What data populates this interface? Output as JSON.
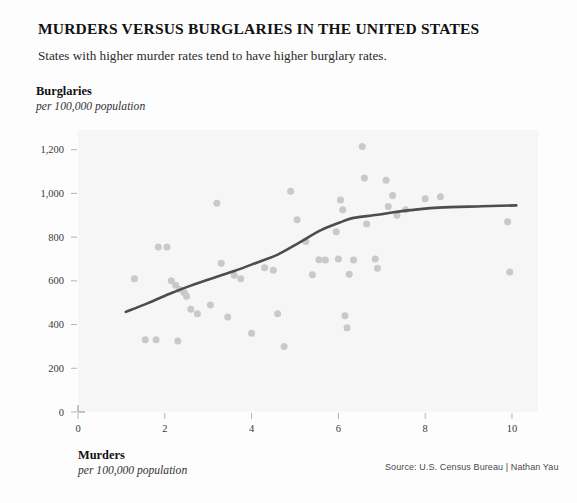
{
  "header": {
    "title": "MURDERS VERSUS BURGLARIES IN THE UNITED STATES",
    "subtitle": "States with higher murder rates tend to have higher burglary rates."
  },
  "y_axis": {
    "title": "Burglaries",
    "units": "per 100,000 population"
  },
  "x_axis": {
    "title": "Murders",
    "units": "per 100,000 population"
  },
  "source": "Source: U.S. Census Bureau | Nathan Yau",
  "colors": {
    "dot": "#c9c9c9",
    "trend_line": "#4d4d4d",
    "plot_background": "#f6f6f6",
    "text": "#222222",
    "page_background": "#fdfdfd"
  },
  "chart_data": {
    "type": "scatter",
    "title": "MURDERS VERSUS BURGLARIES IN THE UNITED STATES",
    "subtitle": "States with higher murder rates tend to have higher burglary rates.",
    "xlabel": "Murders",
    "xlabel_units": "per 100,000 population",
    "ylabel": "Burglaries",
    "ylabel_units": "per 100,000 population",
    "xlim": [
      0,
      10.6
    ],
    "ylim": [
      0,
      1290
    ],
    "xticks": [
      0,
      2,
      4,
      6,
      8,
      10
    ],
    "xtick_labels": [
      "0",
      "2",
      "4",
      "6",
      "8",
      "10"
    ],
    "yticks": [
      0,
      200,
      400,
      600,
      800,
      1000,
      1200
    ],
    "ytick_labels": [
      "0",
      "200",
      "400",
      "600",
      "800",
      "1,000",
      "1,200"
    ],
    "grid": false,
    "legend": "none",
    "points": [
      [
        1.3,
        610
      ],
      [
        1.55,
        330
      ],
      [
        1.8,
        330
      ],
      [
        1.85,
        755
      ],
      [
        2.05,
        755
      ],
      [
        2.15,
        600
      ],
      [
        2.25,
        580
      ],
      [
        2.3,
        325
      ],
      [
        2.35,
        560
      ],
      [
        2.45,
        545
      ],
      [
        2.5,
        530
      ],
      [
        2.6,
        470
      ],
      [
        2.75,
        450
      ],
      [
        3.05,
        490
      ],
      [
        3.2,
        955
      ],
      [
        3.3,
        680
      ],
      [
        3.45,
        435
      ],
      [
        3.6,
        625
      ],
      [
        3.75,
        610
      ],
      [
        4.0,
        360
      ],
      [
        4.3,
        660
      ],
      [
        4.5,
        648
      ],
      [
        4.6,
        450
      ],
      [
        4.75,
        300
      ],
      [
        4.9,
        1010
      ],
      [
        5.05,
        880
      ],
      [
        5.25,
        780
      ],
      [
        5.4,
        628
      ],
      [
        5.55,
        697
      ],
      [
        5.7,
        695
      ],
      [
        5.95,
        825
      ],
      [
        6.0,
        700
      ],
      [
        6.05,
        970
      ],
      [
        6.1,
        925
      ],
      [
        6.15,
        440
      ],
      [
        6.2,
        385
      ],
      [
        6.25,
        630
      ],
      [
        6.35,
        695
      ],
      [
        6.55,
        1215
      ],
      [
        6.6,
        1070
      ],
      [
        6.65,
        860
      ],
      [
        6.85,
        700
      ],
      [
        6.9,
        658
      ],
      [
        7.1,
        1060
      ],
      [
        7.15,
        940
      ],
      [
        7.25,
        990
      ],
      [
        7.35,
        900
      ],
      [
        7.55,
        925
      ],
      [
        8.0,
        975
      ],
      [
        8.35,
        985
      ],
      [
        9.9,
        870
      ],
      [
        9.95,
        640
      ]
    ],
    "trend": {
      "label": "smoothed trend (LOESS)",
      "points": [
        [
          1.1,
          458
        ],
        [
          1.6,
          497
        ],
        [
          2.1,
          540
        ],
        [
          2.6,
          578
        ],
        [
          3.1,
          612
        ],
        [
          3.6,
          645
        ],
        [
          4.1,
          682
        ],
        [
          4.6,
          720
        ],
        [
          5.1,
          775
        ],
        [
          5.6,
          832
        ],
        [
          6.1,
          872
        ],
        [
          6.35,
          888
        ],
        [
          6.9,
          902
        ],
        [
          7.5,
          920
        ],
        [
          8.3,
          935
        ],
        [
          9.3,
          941
        ],
        [
          10.1,
          945
        ]
      ]
    }
  }
}
